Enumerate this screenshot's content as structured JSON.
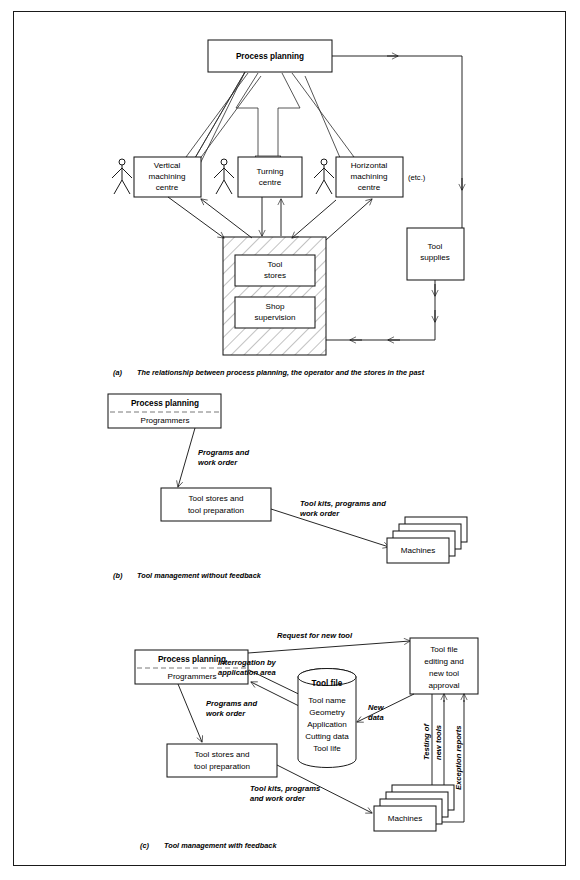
{
  "figure": {
    "panels": [
      {
        "id": "a",
        "caption_label": "(a)",
        "caption": "The relationship between process planning, the operator and the stores in the past",
        "nodes": {
          "process_planning": "Process planning",
          "vertical_machining_centre": "Vertical\nmachining\ncentre",
          "vmc_l1": "Vertical",
          "vmc_l2": "machining",
          "vmc_l3": "centre",
          "turning_centre_l1": "Turning",
          "turning_centre_l2": "centre",
          "hmc_l1": "Horizontal",
          "hmc_l2": "machining",
          "hmc_l3": "centre",
          "etc": "(etc.)",
          "tool_stores_l1": "Tool",
          "tool_stores_l2": "stores",
          "shop_supervision_l1": "Shop",
          "shop_supervision_l2": "supervision",
          "tool_supplies_l1": "Tool",
          "tool_supplies_l2": "supplies"
        }
      },
      {
        "id": "b",
        "caption_label": "(b)",
        "caption": "Tool management without feedback",
        "nodes": {
          "process_planning": "Process planning",
          "programmers": "Programmers",
          "tool_stores_l1": "Tool stores and",
          "tool_stores_l2": "tool preparation",
          "machines": "Machines"
        },
        "edge_labels": {
          "programs_l1": "Programs and",
          "programs_l2": "work order",
          "toolkits_l1": "Tool kits, programs and",
          "toolkits_l2": "work order"
        }
      },
      {
        "id": "c",
        "caption_label": "(c)",
        "caption": "Tool management with feedback",
        "nodes": {
          "process_planning": "Process planning",
          "programmers": "Programmers",
          "tool_stores_l1": "Tool stores and",
          "tool_stores_l2": "tool preparation",
          "machines": "Machines",
          "tool_file_title": "Tool file",
          "tool_file_items": [
            "Tool name",
            "Geometry",
            "Application",
            "Cutting data",
            "Tool life"
          ],
          "tool_file_editing_l1": "Tool file",
          "tool_file_editing_l2": "editing and",
          "tool_file_editing_l3": "new tool",
          "tool_file_editing_l4": "approval"
        },
        "edge_labels": {
          "request_new_tool": "Request for new tool",
          "interrogation_l1": "Interrogation by",
          "interrogation_l2": "application area",
          "programs_l1": "Programs and",
          "programs_l2": "work order",
          "toolkits_l1": "Tool kits, programs",
          "toolkits_l2": "and work order",
          "new_data_l1": "New",
          "new_data_l2": "data",
          "testing_l1": "Testing of",
          "testing_l2": "new tools",
          "exception_reports": "Exception reports"
        }
      }
    ]
  },
  "colors": {
    "ink": "#1a1a1a",
    "paper": "#ffffff",
    "dashed_divider": "#6a6a6a"
  }
}
